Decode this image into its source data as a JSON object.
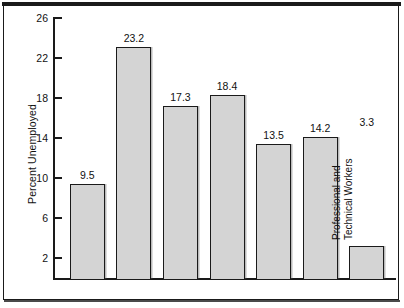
{
  "chart_data": {
    "type": "bar",
    "title": "",
    "xlabel": "",
    "ylabel": "Percent Unemployed",
    "categories": [
      "All Workers",
      "16–19-Year-Olds",
      "Laborers",
      "Blacks",
      "Hispanics",
      "Blue-Collar Workers",
      "Professional and\nTechnical Workers"
    ],
    "values": [
      9.5,
      23.2,
      17.3,
      18.4,
      13.5,
      14.2,
      3.3
    ],
    "value_labels": [
      "9.5",
      "23.2",
      "17.3",
      "18.4",
      "13.5",
      "14.2",
      "3.3"
    ],
    "ylim": [
      0,
      27.5
    ],
    "yticks": [
      2,
      6,
      10,
      14,
      18,
      22,
      26
    ],
    "ytick_labels": [
      "2",
      "6",
      "10",
      "14",
      "18",
      "22",
      "26"
    ],
    "grid": false,
    "legend": null,
    "bar_fill_color": "#d4d4d4",
    "bar_edge_color": "#1a1a1a",
    "category_labels_inside_bars": true,
    "category_label_rotation": -90
  },
  "figure": {
    "frame_color": "#1a1a1a",
    "background_color": "#ffffff"
  }
}
